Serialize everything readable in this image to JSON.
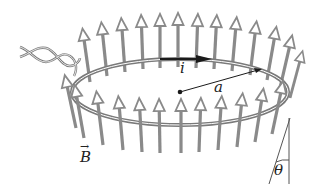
{
  "diagram": {
    "labels": {
      "current": "i",
      "radius": "a",
      "field": "B",
      "field_arrow": "→",
      "angle": "θ"
    },
    "colors": {
      "arrow_gray": "#8a8a8a",
      "wire_gray": "#7a7a7a",
      "ink": "#1a1a1a",
      "background": "#ffffff"
    },
    "ring": {
      "cx": 180,
      "cy": 92,
      "rx": 108,
      "ry": 33
    },
    "field_arrow_count_back": 13,
    "field_arrow_count_front": 12
  }
}
